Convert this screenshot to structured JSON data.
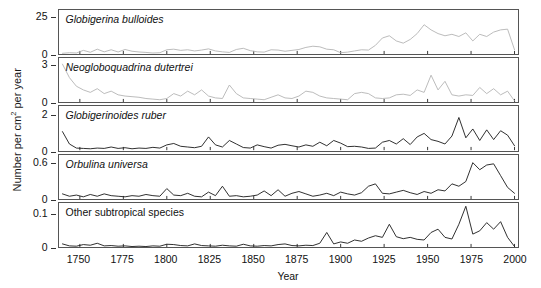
{
  "figure": {
    "ylabel_pre": "Number per cm",
    "ylabel_sup": "2",
    "ylabel_post": " per year",
    "xlabel": "Year",
    "xticks": [
      "1750",
      "1775",
      "1800",
      "1825",
      "1850",
      "1875",
      "1900",
      "1925",
      "1950",
      "1975",
      "2000"
    ],
    "gray_color": "#b4b4b4",
    "black_color": "#1a1a1a",
    "axis_color": "#555555"
  },
  "chart_data": {
    "type": "line",
    "title": "",
    "xlabel": "Year",
    "ylabel": "Number per cm2 per year",
    "xlim": [
      1738,
      2002
    ],
    "grid": false,
    "legend": "none",
    "panels": [
      {
        "label": "Globigerina bulloides",
        "italic": true,
        "color": "#b4b4b4",
        "ylim": [
          0,
          30
        ],
        "yticks": [
          0,
          25
        ],
        "ytick_labels": [
          "0",
          "25"
        ],
        "x": [
          1740,
          1744,
          1748,
          1752,
          1756,
          1760,
          1764,
          1768,
          1772,
          1776,
          1780,
          1784,
          1788,
          1792,
          1796,
          1800,
          1804,
          1808,
          1812,
          1816,
          1820,
          1824,
          1828,
          1832,
          1836,
          1840,
          1844,
          1848,
          1852,
          1856,
          1860,
          1864,
          1868,
          1872,
          1876,
          1880,
          1884,
          1888,
          1892,
          1896,
          1900,
          1904,
          1908,
          1912,
          1916,
          1920,
          1924,
          1928,
          1932,
          1936,
          1940,
          1944,
          1948,
          1952,
          1956,
          1960,
          1964,
          1968,
          1972,
          1976,
          1980,
          1984,
          1988,
          1992,
          1996,
          2000
        ],
        "y": [
          0.6,
          1.0,
          0.8,
          2.6,
          1.3,
          3.4,
          1.6,
          3.0,
          1.5,
          3.2,
          2.0,
          1.5,
          1.2,
          0.8,
          1.0,
          3.0,
          3.4,
          2.6,
          3.0,
          2.2,
          2.8,
          3.6,
          2.2,
          1.6,
          1.2,
          3.2,
          4.0,
          2.4,
          1.6,
          1.4,
          3.0,
          2.8,
          2.0,
          2.6,
          3.2,
          4.6,
          5.4,
          5.0,
          3.4,
          3.0,
          1.0,
          1.4,
          2.2,
          3.0,
          2.8,
          6.0,
          11.0,
          12.5,
          9.0,
          7.5,
          10.0,
          14.0,
          20.0,
          16.5,
          14.0,
          12.5,
          13.5,
          12.0,
          14.5,
          9.0,
          13.5,
          12.0,
          15.0,
          16.5,
          17.0,
          3.0
        ]
      },
      {
        "label": "Neogloboquadrina dutertrei",
        "italic": true,
        "color": "#b4b4b4",
        "ylim": [
          0,
          3.6
        ],
        "yticks": [
          0,
          3
        ],
        "ytick_labels": [
          "0",
          "3"
        ],
        "x": [
          1740,
          1744,
          1748,
          1752,
          1756,
          1760,
          1764,
          1768,
          1772,
          1776,
          1780,
          1784,
          1788,
          1792,
          1796,
          1800,
          1804,
          1808,
          1812,
          1816,
          1820,
          1824,
          1828,
          1832,
          1836,
          1840,
          1844,
          1848,
          1852,
          1856,
          1860,
          1864,
          1868,
          1872,
          1876,
          1880,
          1884,
          1888,
          1892,
          1896,
          1900,
          1904,
          1908,
          1912,
          1916,
          1920,
          1924,
          1928,
          1932,
          1936,
          1940,
          1944,
          1948,
          1952,
          1956,
          1960,
          1964,
          1968,
          1972,
          1976,
          1980,
          1984,
          1988,
          1992,
          1996,
          2000
        ],
        "y": [
          3.1,
          2.0,
          1.3,
          1.0,
          0.8,
          1.1,
          0.7,
          0.9,
          0.6,
          0.5,
          0.45,
          0.4,
          0.3,
          0.25,
          0.2,
          0.3,
          0.7,
          0.5,
          0.9,
          0.6,
          1.0,
          0.5,
          0.35,
          0.3,
          1.4,
          0.7,
          0.35,
          0.3,
          0.25,
          0.2,
          0.4,
          0.6,
          0.35,
          0.3,
          0.5,
          0.9,
          0.8,
          0.5,
          0.35,
          0.3,
          0.25,
          0.2,
          0.7,
          0.8,
          0.7,
          0.35,
          0.3,
          0.35,
          0.6,
          0.65,
          0.55,
          1.0,
          0.8,
          2.2,
          1.0,
          1.7,
          0.6,
          0.5,
          0.6,
          0.55,
          1.2,
          0.7,
          1.1,
          0.6,
          0.9,
          0.1
        ]
      },
      {
        "label": "Globigerinoides ruber",
        "italic": true,
        "color": "#1a1a1a",
        "ylim": [
          0,
          2.5
        ],
        "yticks": [
          0,
          2
        ],
        "ytick_labels": [
          "0",
          "2"
        ],
        "x": [
          1740,
          1744,
          1748,
          1752,
          1756,
          1760,
          1764,
          1768,
          1772,
          1776,
          1780,
          1784,
          1788,
          1792,
          1796,
          1800,
          1804,
          1808,
          1812,
          1816,
          1820,
          1824,
          1828,
          1832,
          1836,
          1840,
          1844,
          1848,
          1852,
          1856,
          1860,
          1864,
          1868,
          1872,
          1876,
          1880,
          1884,
          1888,
          1892,
          1896,
          1900,
          1904,
          1908,
          1912,
          1916,
          1920,
          1924,
          1928,
          1932,
          1936,
          1940,
          1944,
          1948,
          1952,
          1956,
          1960,
          1964,
          1968,
          1972,
          1976,
          1980,
          1984,
          1988,
          1992,
          1996,
          2000
        ],
        "y": [
          1.05,
          0.35,
          0.12,
          0.1,
          0.08,
          0.12,
          0.1,
          0.18,
          0.1,
          0.14,
          0.08,
          0.12,
          0.1,
          0.16,
          0.12,
          0.3,
          0.38,
          0.22,
          0.18,
          0.14,
          0.22,
          0.75,
          0.3,
          0.18,
          0.55,
          0.35,
          0.15,
          0.12,
          0.3,
          0.2,
          0.12,
          0.28,
          0.33,
          0.25,
          0.18,
          0.3,
          0.22,
          0.45,
          0.25,
          0.55,
          0.4,
          0.2,
          0.22,
          0.18,
          0.1,
          0.12,
          0.45,
          0.55,
          0.35,
          0.65,
          0.32,
          0.75,
          0.95,
          0.6,
          0.5,
          0.35,
          0.8,
          1.85,
          0.7,
          1.2,
          0.55,
          1.15,
          0.6,
          1.1,
          0.85,
          0.25
        ]
      },
      {
        "label": "Orbulina universa",
        "italic": true,
        "color": "#1a1a1a",
        "ylim": [
          0,
          0.75
        ],
        "yticks": [
          0,
          0.6
        ],
        "ytick_labels": [
          "0",
          "0.6"
        ],
        "x": [
          1740,
          1744,
          1748,
          1752,
          1756,
          1760,
          1764,
          1768,
          1772,
          1776,
          1780,
          1784,
          1788,
          1792,
          1796,
          1800,
          1804,
          1808,
          1812,
          1816,
          1820,
          1824,
          1828,
          1832,
          1836,
          1840,
          1844,
          1848,
          1852,
          1856,
          1860,
          1864,
          1868,
          1872,
          1876,
          1880,
          1884,
          1888,
          1892,
          1896,
          1900,
          1904,
          1908,
          1912,
          1916,
          1920,
          1924,
          1928,
          1932,
          1936,
          1940,
          1944,
          1948,
          1952,
          1956,
          1960,
          1964,
          1968,
          1972,
          1976,
          1980,
          1984,
          1988,
          1992,
          1996,
          2000
        ],
        "y": [
          0.09,
          0.05,
          0.07,
          0.04,
          0.08,
          0.05,
          0.09,
          0.06,
          0.05,
          0.04,
          0.06,
          0.05,
          0.08,
          0.06,
          0.05,
          0.18,
          0.07,
          0.06,
          0.1,
          0.05,
          0.04,
          0.12,
          0.06,
          0.22,
          0.05,
          0.06,
          0.04,
          0.05,
          0.07,
          0.14,
          0.06,
          0.16,
          0.05,
          0.1,
          0.13,
          0.09,
          0.05,
          0.07,
          0.1,
          0.06,
          0.12,
          0.09,
          0.07,
          0.11,
          0.22,
          0.26,
          0.1,
          0.09,
          0.12,
          0.15,
          0.11,
          0.08,
          0.13,
          0.1,
          0.16,
          0.14,
          0.26,
          0.22,
          0.3,
          0.62,
          0.5,
          0.58,
          0.6,
          0.4,
          0.2,
          0.1
        ]
      },
      {
        "label": "Other subtropical species",
        "italic": false,
        "color": "#1a1a1a",
        "ylim": [
          0,
          0.135
        ],
        "yticks": [
          0,
          0.1
        ],
        "ytick_labels": [
          "0",
          "0.1"
        ],
        "x": [
          1740,
          1744,
          1748,
          1752,
          1756,
          1760,
          1764,
          1768,
          1772,
          1776,
          1780,
          1784,
          1788,
          1792,
          1796,
          1800,
          1804,
          1808,
          1812,
          1816,
          1820,
          1824,
          1828,
          1832,
          1836,
          1840,
          1844,
          1848,
          1852,
          1856,
          1860,
          1864,
          1868,
          1872,
          1876,
          1880,
          1884,
          1888,
          1892,
          1896,
          1900,
          1904,
          1908,
          1912,
          1916,
          1920,
          1924,
          1928,
          1932,
          1936,
          1940,
          1944,
          1948,
          1952,
          1956,
          1960,
          1964,
          1968,
          1972,
          1976,
          1980,
          1984,
          1988,
          1992,
          1996,
          2000
        ],
        "y": [
          0.01,
          0.004,
          0.003,
          0.008,
          0.006,
          0.012,
          0.004,
          0.005,
          0.003,
          0.004,
          0.002,
          0.003,
          0.002,
          0.004,
          0.003,
          0.009,
          0.008,
          0.005,
          0.004,
          0.01,
          0.005,
          0.004,
          0.003,
          0.006,
          0.004,
          0.003,
          0.009,
          0.004,
          0.003,
          0.005,
          0.004,
          0.008,
          0.01,
          0.005,
          0.004,
          0.006,
          0.005,
          0.012,
          0.045,
          0.01,
          0.016,
          0.012,
          0.022,
          0.018,
          0.028,
          0.035,
          0.03,
          0.07,
          0.032,
          0.026,
          0.03,
          0.024,
          0.022,
          0.045,
          0.055,
          0.03,
          0.025,
          0.07,
          0.125,
          0.04,
          0.05,
          0.075,
          0.055,
          0.078,
          0.03,
          0.002
        ]
      }
    ]
  }
}
